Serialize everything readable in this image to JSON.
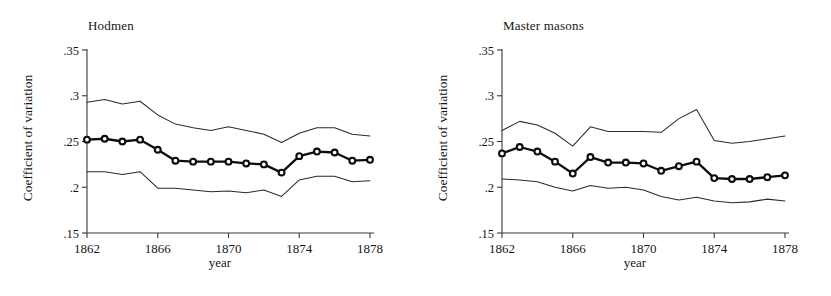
{
  "figure": {
    "background": "#ffffff",
    "line_color": "#0d0d0d",
    "ci_color": "#2b2b2b",
    "axis_color": "#3a3a3a"
  },
  "panels": [
    {
      "title": "Hodmen",
      "ylabel": "Coefficient of variation",
      "xlabel": "year"
    },
    {
      "title": "Master masons",
      "ylabel": "Coefficient of variation",
      "xlabel": "year"
    }
  ],
  "chart_data": [
    {
      "type": "line",
      "title": "Hodmen",
      "xlabel": "year",
      "ylabel": "Coefficient of variation",
      "xlim": [
        1862,
        1878
      ],
      "ylim": [
        0.15,
        0.35
      ],
      "xticks": [
        1862,
        1866,
        1870,
        1874,
        1878
      ],
      "xtick_labels": [
        "1862",
        "1866",
        "1870",
        "1874",
        "1878"
      ],
      "yticks": [
        0.15,
        0.2,
        0.25,
        0.3,
        0.35
      ],
      "ytick_labels": [
        ".15",
        ".2",
        ".25",
        ".3",
        ".35"
      ],
      "grid": false,
      "legend": "none",
      "x": [
        1862,
        1863,
        1864,
        1865,
        1866,
        1867,
        1868,
        1869,
        1870,
        1871,
        1872,
        1873,
        1874,
        1875,
        1876,
        1877,
        1878
      ],
      "series": [
        {
          "name": "Coefficient of variation",
          "marker": "circle",
          "values": [
            0.252,
            0.253,
            0.25,
            0.252,
            0.241,
            0.229,
            0.228,
            0.228,
            0.228,
            0.226,
            0.225,
            0.216,
            0.234,
            0.239,
            0.238,
            0.229,
            0.23
          ]
        },
        {
          "name": "Upper confidence bound",
          "marker": "none",
          "values": [
            0.293,
            0.296,
            0.291,
            0.294,
            0.279,
            0.269,
            0.265,
            0.262,
            0.266,
            0.262,
            0.258,
            0.249,
            0.259,
            0.265,
            0.265,
            0.258,
            0.256
          ]
        },
        {
          "name": "Lower confidence bound",
          "marker": "none",
          "values": [
            0.217,
            0.217,
            0.214,
            0.217,
            0.199,
            0.199,
            0.197,
            0.195,
            0.196,
            0.194,
            0.197,
            0.19,
            0.208,
            0.212,
            0.212,
            0.206,
            0.207
          ]
        }
      ]
    },
    {
      "type": "line",
      "title": "Master masons",
      "xlabel": "year",
      "ylabel": "Coefficient of variation",
      "xlim": [
        1862,
        1878
      ],
      "ylim": [
        0.15,
        0.35
      ],
      "xticks": [
        1862,
        1866,
        1870,
        1874,
        1878
      ],
      "xtick_labels": [
        "1862",
        "1866",
        "1870",
        "1874",
        "1878"
      ],
      "yticks": [
        0.15,
        0.2,
        0.25,
        0.3,
        0.35
      ],
      "ytick_labels": [
        ".15",
        ".2",
        ".25",
        ".3",
        ".35"
      ],
      "grid": false,
      "legend": "none",
      "x": [
        1862,
        1863,
        1864,
        1865,
        1866,
        1867,
        1868,
        1869,
        1870,
        1871,
        1872,
        1873,
        1874,
        1875,
        1876,
        1877,
        1878
      ],
      "series": [
        {
          "name": "Coefficient of variation",
          "marker": "circle",
          "values": [
            0.237,
            0.244,
            0.239,
            0.228,
            0.215,
            0.233,
            0.227,
            0.227,
            0.226,
            0.218,
            0.223,
            0.228,
            0.21,
            0.209,
            0.209,
            0.211,
            0.213
          ]
        },
        {
          "name": "Upper confidence bound",
          "marker": "none",
          "values": [
            0.262,
            0.272,
            0.268,
            0.259,
            0.245,
            0.266,
            0.261,
            0.261,
            0.261,
            0.26,
            0.275,
            0.285,
            0.251,
            0.248,
            0.25,
            0.253,
            0.256
          ]
        },
        {
          "name": "Lower confidence bound",
          "marker": "none",
          "values": [
            0.209,
            0.208,
            0.206,
            0.2,
            0.196,
            0.202,
            0.199,
            0.2,
            0.197,
            0.19,
            0.186,
            0.189,
            0.185,
            0.183,
            0.184,
            0.187,
            0.185
          ]
        }
      ]
    }
  ]
}
